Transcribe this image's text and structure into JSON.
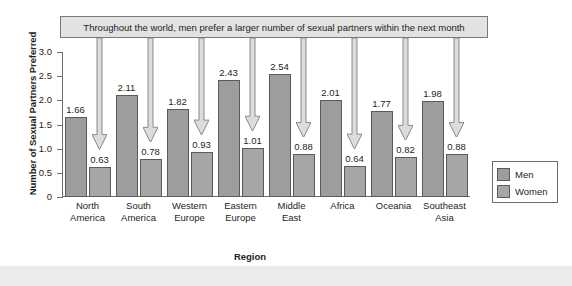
{
  "chart_data": {
    "type": "bar",
    "title": "Throughout the world, men prefer a larger number of sexual partners within the next month",
    "xlabel": "Region",
    "ylabel": "Number of Sexual Partners Preferred",
    "ylim": [
      0,
      3.0
    ],
    "yticks": [
      "0",
      "0.5",
      "1.0",
      "1.5",
      "2.0",
      "2.5",
      "3.0"
    ],
    "ytick_values": [
      0,
      0.5,
      1.0,
      1.5,
      2.0,
      2.5,
      3.0
    ],
    "grid": false,
    "legend_position": "right",
    "categories": [
      "North America",
      "South America",
      "Western Europe",
      "Eastern Europe",
      "Middle East",
      "Africa",
      "Oceania",
      "Southeast Asia"
    ],
    "category_lines": [
      [
        "North",
        "America"
      ],
      [
        "South",
        "America"
      ],
      [
        "Western",
        "Europe"
      ],
      [
        "Eastern",
        "Europe"
      ],
      [
        "Middle",
        "East"
      ],
      [
        "Africa",
        ""
      ],
      [
        "Oceania",
        ""
      ],
      [
        "Southeast",
        "Asia"
      ]
    ],
    "series": [
      {
        "name": "Men",
        "color": "#9d9d9d",
        "values": [
          1.66,
          2.11,
          1.82,
          2.43,
          2.54,
          2.01,
          1.77,
          1.98
        ],
        "labels": [
          "1.66",
          "2.11",
          "1.82",
          "2.43",
          "2.54",
          "2.01",
          "1.77",
          "1.98"
        ]
      },
      {
        "name": "Women",
        "color": "#a6a6a6",
        "values": [
          0.63,
          0.78,
          0.93,
          1.01,
          0.88,
          0.64,
          0.82,
          0.88
        ],
        "labels": [
          "0.63",
          "0.78",
          "0.93",
          "1.01",
          "0.88",
          "0.64",
          "0.82",
          "0.88"
        ]
      }
    ],
    "annotations": {
      "arrow_count": 8,
      "arrow_description": "Downward arrows from the banner pointing to each Women bar",
      "arrow_color": "#d6d6d6"
    }
  },
  "legend": {
    "items": [
      {
        "label": "Men"
      },
      {
        "label": "Women"
      }
    ]
  }
}
